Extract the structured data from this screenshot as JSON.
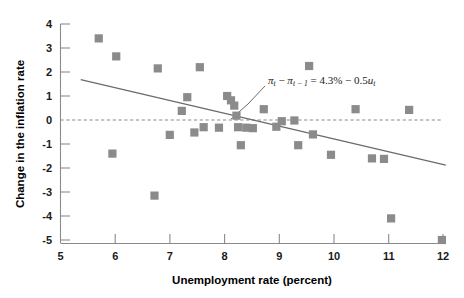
{
  "chart_data": {
    "type": "scatter",
    "title": "",
    "xlabel": "Unemployment rate (percent)",
    "ylabel": "Change in the inflation rate",
    "xlim": [
      5,
      12
    ],
    "ylim": [
      -5,
      4
    ],
    "xticks": [
      "5",
      "6",
      "7",
      "8",
      "9",
      "10",
      "11",
      "12"
    ],
    "yticks": [
      "4",
      "3",
      "2",
      "1",
      "0",
      "-1",
      "-2",
      "-3",
      "-4",
      "-5"
    ],
    "grid": false,
    "legend": "none",
    "zero_reference_line": 0,
    "points": [
      {
        "x": 5.7,
        "y": 3.4
      },
      {
        "x": 6.02,
        "y": 2.65
      },
      {
        "x": 5.95,
        "y": -1.4
      },
      {
        "x": 6.78,
        "y": 2.15
      },
      {
        "x": 6.72,
        "y": -3.15
      },
      {
        "x": 7.0,
        "y": -0.62
      },
      {
        "x": 7.32,
        "y": 0.95
      },
      {
        "x": 7.22,
        "y": 0.38
      },
      {
        "x": 7.45,
        "y": -0.52
      },
      {
        "x": 7.55,
        "y": 2.2
      },
      {
        "x": 7.62,
        "y": -0.3
      },
      {
        "x": 7.9,
        "y": -0.32
      },
      {
        "x": 8.05,
        "y": 1.0
      },
      {
        "x": 8.12,
        "y": 0.82
      },
      {
        "x": 8.18,
        "y": 0.6
      },
      {
        "x": 8.22,
        "y": 0.18
      },
      {
        "x": 8.25,
        "y": -0.3
      },
      {
        "x": 8.4,
        "y": -0.32
      },
      {
        "x": 8.52,
        "y": -0.34
      },
      {
        "x": 8.3,
        "y": -1.05
      },
      {
        "x": 8.72,
        "y": 0.45
      },
      {
        "x": 8.95,
        "y": -0.28
      },
      {
        "x": 9.05,
        "y": -0.05
      },
      {
        "x": 9.28,
        "y": -0.02
      },
      {
        "x": 9.55,
        "y": 2.25
      },
      {
        "x": 9.62,
        "y": -0.6
      },
      {
        "x": 9.35,
        "y": -1.05
      },
      {
        "x": 9.95,
        "y": -1.45
      },
      {
        "x": 10.4,
        "y": 0.45
      },
      {
        "x": 10.7,
        "y": -1.6
      },
      {
        "x": 10.92,
        "y": -1.62
      },
      {
        "x": 11.05,
        "y": -4.1
      },
      {
        "x": 11.38,
        "y": 0.42
      },
      {
        "x": 11.98,
        "y": -5.0
      }
    ],
    "fit_line": {
      "equation_plain": "πt − πt−1 = 4.3% − 0.5ut",
      "intercept": 4.3,
      "slope": -0.5,
      "x_start": 5.37,
      "y_start": 1.68,
      "x_end": 12.05,
      "y_end": -1.88
    },
    "annotation": {
      "pi_symbol": "π",
      "sub_t": "t",
      "minus": "−",
      "sub_t_minus_1": "t − 1",
      "equals": "=",
      "rhs_a": "4.3%",
      "rhs_minus": "−",
      "rhs_b": "0.5",
      "u_symbol": "u",
      "u_sub": "t"
    }
  }
}
